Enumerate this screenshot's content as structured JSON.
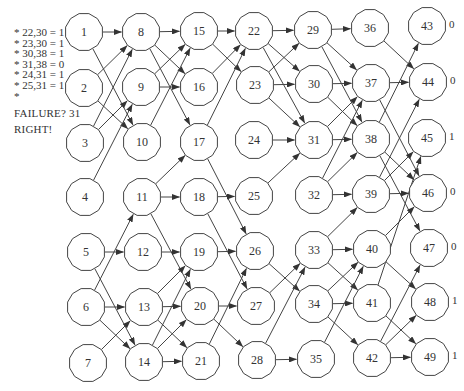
{
  "legend": {
    "lines": [
      "* 22,30 = 1",
      "* 23,30 = 1",
      "* 30,38 = 1",
      "* 31,38 = 0",
      "* 24,31 = 1",
      "* 25,31 = 1",
      "*"
    ]
  },
  "status": {
    "failure_label": "FAILURE?  31",
    "result_label": "RIGHT!"
  },
  "nodes": [
    {
      "id": "1",
      "x": 84,
      "y": 32
    },
    {
      "id": "2",
      "x": 84,
      "y": 88
    },
    {
      "id": "3",
      "x": 85,
      "y": 143
    },
    {
      "id": "4",
      "x": 85,
      "y": 197
    },
    {
      "id": "5",
      "x": 86,
      "y": 252
    },
    {
      "id": "6",
      "x": 86,
      "y": 307
    },
    {
      "id": "7",
      "x": 88,
      "y": 363
    },
    {
      "id": "8",
      "x": 141,
      "y": 32
    },
    {
      "id": "9",
      "x": 141,
      "y": 87
    },
    {
      "id": "10",
      "x": 142,
      "y": 142
    },
    {
      "id": "11",
      "x": 142,
      "y": 197
    },
    {
      "id": "12",
      "x": 143,
      "y": 252
    },
    {
      "id": "13",
      "x": 144,
      "y": 307
    },
    {
      "id": "14",
      "x": 144,
      "y": 362
    },
    {
      "id": "15",
      "x": 199,
      "y": 31
    },
    {
      "id": "16",
      "x": 199,
      "y": 87
    },
    {
      "id": "17",
      "x": 199,
      "y": 142
    },
    {
      "id": "18",
      "x": 199,
      "y": 197
    },
    {
      "id": "19",
      "x": 199,
      "y": 252
    },
    {
      "id": "20",
      "x": 200,
      "y": 306
    },
    {
      "id": "21",
      "x": 201,
      "y": 361
    },
    {
      "id": "22",
      "x": 254,
      "y": 31
    },
    {
      "id": "23",
      "x": 255,
      "y": 85
    },
    {
      "id": "24",
      "x": 254,
      "y": 140
    },
    {
      "id": "25",
      "x": 254,
      "y": 196
    },
    {
      "id": "26",
      "x": 255,
      "y": 251
    },
    {
      "id": "27",
      "x": 256,
      "y": 306
    },
    {
      "id": "28",
      "x": 257,
      "y": 360
    },
    {
      "id": "29",
      "x": 313,
      "y": 30
    },
    {
      "id": "30",
      "x": 314,
      "y": 84
    },
    {
      "id": "31",
      "x": 314,
      "y": 140
    },
    {
      "id": "32",
      "x": 314,
      "y": 195
    },
    {
      "id": "33",
      "x": 314,
      "y": 250
    },
    {
      "id": "34",
      "x": 314,
      "y": 304
    },
    {
      "id": "35",
      "x": 316,
      "y": 359
    },
    {
      "id": "36",
      "x": 370,
      "y": 28
    },
    {
      "id": "37",
      "x": 371,
      "y": 83
    },
    {
      "id": "38",
      "x": 371,
      "y": 139
    },
    {
      "id": "39",
      "x": 371,
      "y": 194
    },
    {
      "id": "40",
      "x": 372,
      "y": 249
    },
    {
      "id": "41",
      "x": 372,
      "y": 303
    },
    {
      "id": "42",
      "x": 372,
      "y": 358
    },
    {
      "id": "43",
      "x": 427,
      "y": 26
    },
    {
      "id": "44",
      "x": 428,
      "y": 82
    },
    {
      "id": "45",
      "x": 427,
      "y": 138
    },
    {
      "id": "46",
      "x": 428,
      "y": 193
    },
    {
      "id": "47",
      "x": 429,
      "y": 248
    },
    {
      "id": "48",
      "x": 430,
      "y": 302
    },
    {
      "id": "49",
      "x": 430,
      "y": 357
    }
  ],
  "edges": [
    [
      "1",
      "8"
    ],
    [
      "1",
      "10"
    ],
    [
      "2",
      "8"
    ],
    [
      "2",
      "10"
    ],
    [
      "3",
      "8"
    ],
    [
      "3",
      "9"
    ],
    [
      "4",
      "9"
    ],
    [
      "5",
      "12"
    ],
    [
      "5",
      "14"
    ],
    [
      "6",
      "11"
    ],
    [
      "6",
      "13"
    ],
    [
      "6",
      "14"
    ],
    [
      "7",
      "13"
    ],
    [
      "8",
      "15"
    ],
    [
      "8",
      "16"
    ],
    [
      "8",
      "17"
    ],
    [
      "9",
      "15"
    ],
    [
      "9",
      "16"
    ],
    [
      "10",
      "15"
    ],
    [
      "11",
      "17"
    ],
    [
      "11",
      "18"
    ],
    [
      "11",
      "20"
    ],
    [
      "12",
      "19"
    ],
    [
      "13",
      "19"
    ],
    [
      "13",
      "20"
    ],
    [
      "13",
      "21"
    ],
    [
      "14",
      "19"
    ],
    [
      "14",
      "20"
    ],
    [
      "14",
      "21"
    ],
    [
      "15",
      "22"
    ],
    [
      "15",
      "23"
    ],
    [
      "16",
      "22"
    ],
    [
      "17",
      "22"
    ],
    [
      "17",
      "26"
    ],
    [
      "18",
      "25"
    ],
    [
      "18",
      "27"
    ],
    [
      "19",
      "26"
    ],
    [
      "20",
      "27"
    ],
    [
      "20",
      "28"
    ],
    [
      "21",
      "26"
    ],
    [
      "22",
      "29"
    ],
    [
      "22",
      "30"
    ],
    [
      "22",
      "31"
    ],
    [
      "23",
      "29"
    ],
    [
      "23",
      "30"
    ],
    [
      "23",
      "31"
    ],
    [
      "24",
      "31"
    ],
    [
      "25",
      "31"
    ],
    [
      "26",
      "34"
    ],
    [
      "27",
      "33"
    ],
    [
      "28",
      "33"
    ],
    [
      "28",
      "35"
    ],
    [
      "29",
      "36"
    ],
    [
      "29",
      "37"
    ],
    [
      "29",
      "38"
    ],
    [
      "30",
      "37"
    ],
    [
      "30",
      "38"
    ],
    [
      "31",
      "37"
    ],
    [
      "31",
      "38"
    ],
    [
      "32",
      "37"
    ],
    [
      "32",
      "38"
    ],
    [
      "32",
      "39"
    ],
    [
      "33",
      "39"
    ],
    [
      "33",
      "40"
    ],
    [
      "33",
      "41"
    ],
    [
      "34",
      "40"
    ],
    [
      "34",
      "41"
    ],
    [
      "34",
      "42"
    ],
    [
      "35",
      "40"
    ],
    [
      "36",
      "44"
    ],
    [
      "37",
      "44"
    ],
    [
      "37",
      "46"
    ],
    [
      "38",
      "43"
    ],
    [
      "38",
      "46"
    ],
    [
      "38",
      "47"
    ],
    [
      "39",
      "44"
    ],
    [
      "39",
      "45"
    ],
    [
      "39",
      "46"
    ],
    [
      "40",
      "46"
    ],
    [
      "40",
      "48"
    ],
    [
      "41",
      "45"
    ],
    [
      "41",
      "49"
    ],
    [
      "42",
      "47"
    ],
    [
      "42",
      "48"
    ],
    [
      "42",
      "49"
    ]
  ],
  "outputs": [
    {
      "node": "43",
      "value": "0"
    },
    {
      "node": "44",
      "value": "0"
    },
    {
      "node": "45",
      "value": "1"
    },
    {
      "node": "46",
      "value": "0"
    },
    {
      "node": "47",
      "value": "0"
    },
    {
      "node": "48",
      "value": "1"
    },
    {
      "node": "49",
      "value": "1"
    }
  ],
  "style": {
    "node_radius": 19,
    "stroke_color": "#444444",
    "node_fill": "#ffffff"
  }
}
